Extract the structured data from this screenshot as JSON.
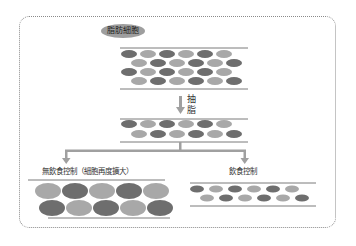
{
  "diagram": {
    "title": "脂肪細胞",
    "step_label": "抽脂",
    "step_label_line1": "抽",
    "step_label_line2": "脂",
    "branch_left_label": "無飲食控制（細胞再度擴大）",
    "branch_right_label": "飲食控制"
  },
  "colors": {
    "dark_cell": "#6e6e6e",
    "light_cell": "#a8a8a8",
    "line": "#7a7a7a",
    "frame": "#8a8a8a"
  },
  "blocks": {
    "top": {
      "rows": 4,
      "cells_per_row": 6,
      "pattern": [
        "dark-first",
        "light-first-offset",
        "dark-first",
        "light-first-offset"
      ]
    },
    "middle": {
      "rows": 2,
      "cells_per_row": 6,
      "pattern": [
        "dark-first",
        "light-first-offset"
      ]
    },
    "bottom_left": {
      "rows": 2,
      "cells_per_row": 5,
      "pattern": [
        "light-first",
        "dark-first"
      ],
      "size": "large"
    },
    "bottom_right": {
      "rows": 2,
      "cells_per_row": 6,
      "pattern": [
        "dark-first",
        "light-first-offset"
      ],
      "size": "small"
    }
  }
}
